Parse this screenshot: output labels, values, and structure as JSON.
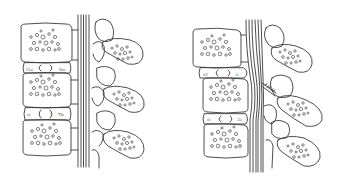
{
  "figure": {
    "panels": [
      {
        "id": "normal",
        "label": "Normal spine segment: three vertebral bodies, two intervertebral discs, straight spinal nerve bundle, three spinous processes"
      },
      {
        "id": "herniated",
        "label": "Herniated disc: displaced disc bulging into and compressing the nerve bundle, with a pinched nerve root"
      }
    ],
    "colors": {
      "stroke": "#3a3a3a",
      "background": "#ffffff"
    }
  }
}
